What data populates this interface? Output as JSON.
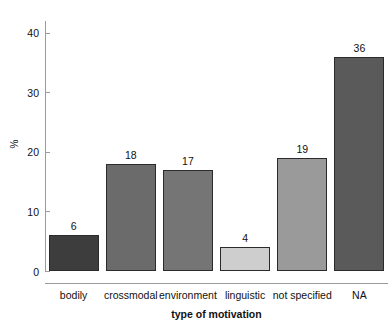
{
  "chart_data": {
    "type": "bar",
    "title": "",
    "xlabel": "type of motivation",
    "ylabel": "%",
    "categories": [
      "bodily",
      "crossmodal",
      "environment",
      "linguistic",
      "not specified",
      "NA"
    ],
    "values": [
      6,
      18,
      17,
      4,
      19,
      36
    ],
    "value_labels": [
      "6",
      "18",
      "17",
      "4",
      "19",
      "36"
    ],
    "bar_colors": [
      "#3d3d3d",
      "#6b6b6b",
      "#757575",
      "#cecece",
      "#9a9a9a",
      "#5a5a5a"
    ],
    "bar_border_color": "#2b2b2b",
    "ylim": [
      0,
      42
    ],
    "yticks": [
      0,
      10,
      20,
      30,
      40
    ],
    "ytick_labels": [
      "0",
      "10",
      "20",
      "30",
      "40"
    ],
    "grid": false,
    "legend": "none",
    "axis_color": "#9a9a9a",
    "background": "#ffffff"
  },
  "axes": {
    "y_title": "%",
    "x_title": "type of motivation"
  }
}
